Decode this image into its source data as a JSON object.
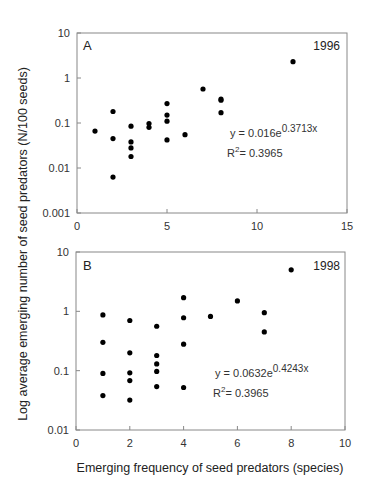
{
  "figure": {
    "ylabel": "Log average emerging number of seed predators (N/100 seeds)",
    "xlabel": "Emerging frequency of seed predators (species)"
  },
  "chart_data": [
    {
      "type": "scatter",
      "panel": "A",
      "title": "1996",
      "xlabel": "Emerging frequency of seed predators (species)",
      "ylabel": "Log average emerging number of seed predators (N/100 seeds)",
      "xlim": [
        0,
        15
      ],
      "ylim": [
        0.001,
        10
      ],
      "yscale": "log",
      "xticks": [
        "0",
        "5",
        "10",
        "15"
      ],
      "yticks": [
        "10",
        "1",
        "0.1",
        "0.01",
        "0.001"
      ],
      "equation": "y = 0.016e",
      "equation_exponent": "0.3713x",
      "r2_label": "R",
      "r2_sup": "2",
      "r2_value": "= 0.3965",
      "grid": false,
      "points": [
        {
          "x": 1,
          "y": 0.066
        },
        {
          "x": 2,
          "y": 0.18
        },
        {
          "x": 2,
          "y": 0.045
        },
        {
          "x": 2,
          "y": 0.0063
        },
        {
          "x": 3,
          "y": 0.085
        },
        {
          "x": 3,
          "y": 0.038
        },
        {
          "x": 3,
          "y": 0.028
        },
        {
          "x": 3,
          "y": 0.018
        },
        {
          "x": 4,
          "y": 0.097
        },
        {
          "x": 4,
          "y": 0.08
        },
        {
          "x": 5,
          "y": 0.27
        },
        {
          "x": 5,
          "y": 0.15
        },
        {
          "x": 5,
          "y": 0.11
        },
        {
          "x": 5,
          "y": 0.042
        },
        {
          "x": 6,
          "y": 0.055
        },
        {
          "x": 7,
          "y": 0.57
        },
        {
          "x": 8,
          "y": 0.34
        },
        {
          "x": 8,
          "y": 0.32
        },
        {
          "x": 8,
          "y": 0.17
        },
        {
          "x": 12,
          "y": 2.3
        }
      ]
    },
    {
      "type": "scatter",
      "panel": "B",
      "title": "1998",
      "xlabel": "Emerging frequency of seed predators (species)",
      "ylabel": "Log average emerging number of seed predators (N/100 seeds)",
      "xlim": [
        0,
        10
      ],
      "ylim": [
        0.01,
        10
      ],
      "yscale": "log",
      "xticks": [
        "0",
        "2",
        "4",
        "6",
        "8",
        "10"
      ],
      "yticks": [
        "10",
        "1",
        "0.1",
        "0.01"
      ],
      "equation": "y = 0.0632e",
      "equation_exponent": "0.4243x",
      "r2_label": "R",
      "r2_sup": "2",
      "r2_value": "= 0.3965",
      "grid": false,
      "points": [
        {
          "x": 1,
          "y": 0.87
        },
        {
          "x": 1,
          "y": 0.3
        },
        {
          "x": 1,
          "y": 0.09
        },
        {
          "x": 1,
          "y": 0.038
        },
        {
          "x": 2,
          "y": 0.7
        },
        {
          "x": 2,
          "y": 0.2
        },
        {
          "x": 2,
          "y": 0.092
        },
        {
          "x": 2,
          "y": 0.068
        },
        {
          "x": 2,
          "y": 0.032
        },
        {
          "x": 3,
          "y": 0.56
        },
        {
          "x": 3,
          "y": 0.18
        },
        {
          "x": 3,
          "y": 0.13
        },
        {
          "x": 3,
          "y": 0.097
        },
        {
          "x": 3,
          "y": 0.054
        },
        {
          "x": 4,
          "y": 1.7
        },
        {
          "x": 4,
          "y": 0.78
        },
        {
          "x": 4,
          "y": 0.28
        },
        {
          "x": 4,
          "y": 0.052
        },
        {
          "x": 5,
          "y": 0.82
        },
        {
          "x": 6,
          "y": 1.5
        },
        {
          "x": 7,
          "y": 0.95
        },
        {
          "x": 7,
          "y": 0.45
        },
        {
          "x": 8,
          "y": 5.0
        }
      ]
    }
  ]
}
